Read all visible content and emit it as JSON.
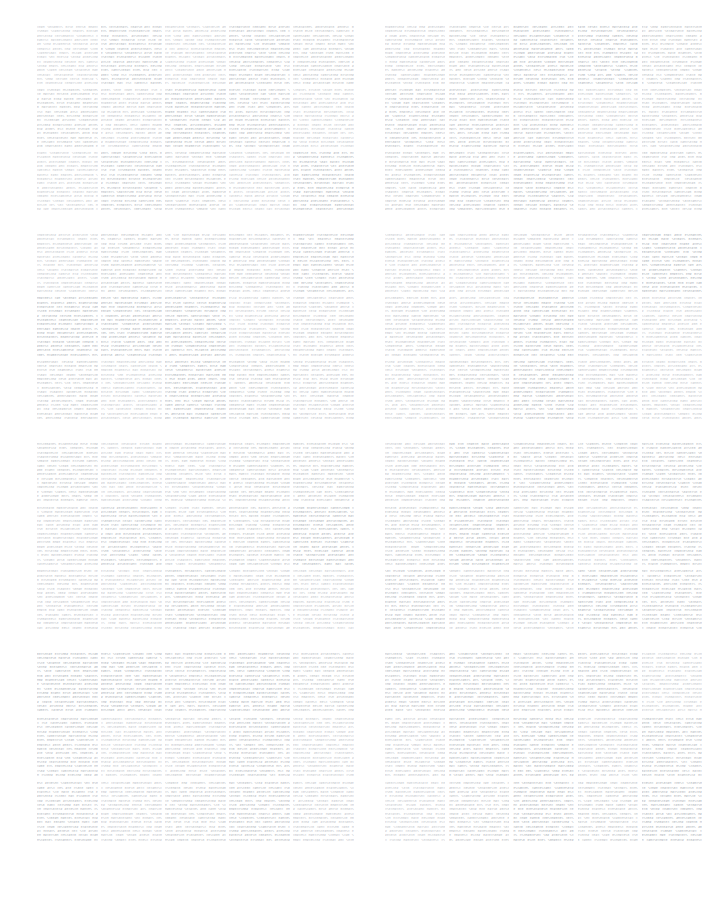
{
  "page": {
    "background_color": "#ffffff",
    "text_color": "#b4b9bf",
    "width": 718,
    "height": 901
  },
  "layout": {
    "panel_rows": 4,
    "panel_columns": 2,
    "cells_per_panel_columns": 5,
    "cells_per_panel_rows": 3,
    "total_panels": 8,
    "total_cells": 120
  },
  "panels": [
    {
      "id": "panel-1",
      "row": 1,
      "column": "left",
      "label": ""
    },
    {
      "id": "panel-2",
      "row": 1,
      "column": "right",
      "label": ""
    },
    {
      "id": "panel-3",
      "row": 2,
      "column": "left",
      "label": ""
    },
    {
      "id": "panel-4",
      "row": 2,
      "column": "right",
      "label": ""
    },
    {
      "id": "panel-5",
      "row": 3,
      "column": "left",
      "label": ""
    },
    {
      "id": "panel-6",
      "row": 3,
      "column": "right",
      "label": ""
    },
    {
      "id": "panel-7",
      "row": 4,
      "column": "left",
      "label": ""
    },
    {
      "id": "panel-8",
      "row": 4,
      "column": "right",
      "label": ""
    }
  ],
  "micro_text": {
    "glyph_pool": "XEX#XM%X#BX%EXM#XEX%BXM#X%XEBX#MX%EXB#XM%XE#BX%MXE#XBX%EXM#X%BXEX#MX%XEB#XM%XE#BXM%X#EXB%XM#XE%BX#MXE%X#BXM%EX#XB%MXE#X%BXEM#X%XBE#MX%EXB#X%MXE#BX%XEM#XB%XE#MXB%X#EMX%B#XEX%MB#XEX%BM#EXX%MB#XEB%XM#EXB%MX#BEX%MX#EBX%XM#BXE%MX#XBE%XM#EXM%BX#XEM%XB#MEX%BX#XME%XB#EMX%XB#MXE%BX#",
    "fill_mode": "justified",
    "legible": false
  }
}
